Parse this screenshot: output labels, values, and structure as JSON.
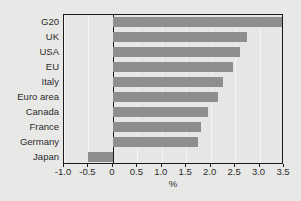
{
  "chart_data": {
    "type": "bar",
    "orientation": "horizontal",
    "title": "",
    "subtitle": "",
    "xlabel": "%",
    "ylabel": "",
    "categories": [
      "G20",
      "UK",
      "USA",
      "EU",
      "Italy",
      "Euro area",
      "Canada",
      "France",
      "Germany",
      "Japan"
    ],
    "values": [
      3.5,
      2.75,
      2.6,
      2.45,
      2.25,
      2.15,
      1.95,
      1.8,
      1.75,
      -0.5
    ],
    "xlim": [
      -1.0,
      3.5
    ],
    "xticks": [
      -1.0,
      -0.5,
      0,
      0.5,
      1.0,
      1.5,
      2.0,
      2.5,
      3.0,
      3.5
    ],
    "xticklabels": [
      "-1.0",
      "-0.5",
      "0",
      "0.5",
      "1.0",
      "1.5",
      "2.0",
      "2.5",
      "3.0",
      "3.5"
    ],
    "grid": true,
    "grid_axis": "x",
    "legend": false,
    "legend_position": "none",
    "bar_color": "#8e8e8e",
    "background_color": "#e8e8e6",
    "plot_background_color": "#e6e6e4",
    "axis_color": "#1a1a1a",
    "gridline_color": "#f4f4f2",
    "zero_line": 0
  }
}
